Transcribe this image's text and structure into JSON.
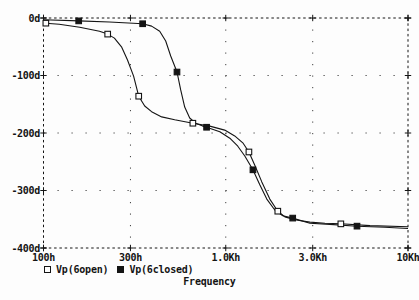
{
  "page": {
    "background": "#fdfdfd",
    "ink": "#141414"
  },
  "chart_data": {
    "type": "line",
    "title": "",
    "xlabel": "Frequency",
    "ylabel": "",
    "x_scale": "log",
    "xlim": [
      100,
      10000
    ],
    "ylim": [
      -400,
      0
    ],
    "grid": "dotted interior gridlines, dashed plot border with + tick marks",
    "legend_position": "bottom-left",
    "x_ticks": [
      {
        "value": 100,
        "label": "100h"
      },
      {
        "value": 300,
        "label": "300h"
      },
      {
        "value": 1000,
        "label": "1.0Kh"
      },
      {
        "value": 3000,
        "label": "3.0Kh"
      },
      {
        "value": 10000,
        "label": "10Kh"
      }
    ],
    "y_ticks": [
      {
        "value": 0,
        "label": "0d"
      },
      {
        "value": -100,
        "label": "-100d"
      },
      {
        "value": -200,
        "label": "-200d"
      },
      {
        "value": -300,
        "label": "-300d"
      },
      {
        "value": -400,
        "label": "-400d"
      }
    ],
    "series": [
      {
        "name": "Vp(6open)",
        "marker": "open-square",
        "color": "#141414",
        "points": [
          [
            100,
            -8
          ],
          [
            103,
            -9
          ],
          [
            122,
            -11
          ],
          [
            158,
            -16
          ],
          [
            203,
            -23
          ],
          [
            225,
            -28
          ],
          [
            245,
            -35
          ],
          [
            268,
            -50
          ],
          [
            289,
            -73
          ],
          [
            312,
            -101
          ],
          [
            333,
            -136
          ],
          [
            359,
            -153
          ],
          [
            392,
            -163
          ],
          [
            445,
            -172
          ],
          [
            525,
            -177
          ],
          [
            660,
            -183
          ],
          [
            817,
            -188
          ],
          [
            987,
            -195
          ],
          [
            1120,
            -205
          ],
          [
            1240,
            -217
          ],
          [
            1340,
            -233
          ],
          [
            1443,
            -256
          ],
          [
            1577,
            -285
          ],
          [
            1745,
            -315
          ],
          [
            1930,
            -336
          ],
          [
            2110,
            -346
          ],
          [
            2394,
            -351
          ],
          [
            2894,
            -355
          ],
          [
            3500,
            -357
          ],
          [
            4280,
            -358
          ],
          [
            6185,
            -361
          ],
          [
            10000,
            -363
          ]
        ],
        "marker_points": [
          [
            103,
            -9
          ],
          [
            225,
            -28
          ],
          [
            333,
            -136
          ],
          [
            660,
            -183
          ],
          [
            1340,
            -233
          ],
          [
            1930,
            -336
          ],
          [
            4280,
            -358
          ]
        ]
      },
      {
        "name": "Vp(6closed)",
        "marker": "filled-square",
        "color": "#141414",
        "points": [
          [
            100,
            -3
          ],
          [
            156,
            -5
          ],
          [
            230,
            -7
          ],
          [
            350,
            -10
          ],
          [
            392,
            -14
          ],
          [
            434,
            -23
          ],
          [
            468,
            -40
          ],
          [
            499,
            -66
          ],
          [
            540,
            -94
          ],
          [
            566,
            -125
          ],
          [
            595,
            -155
          ],
          [
            634,
            -174
          ],
          [
            684,
            -183
          ],
          [
            747,
            -188
          ],
          [
            785,
            -190
          ],
          [
            927,
            -198
          ],
          [
            1052,
            -209
          ],
          [
            1164,
            -223
          ],
          [
            1272,
            -240
          ],
          [
            1410,
            -264
          ],
          [
            1538,
            -290
          ],
          [
            1680,
            -315
          ],
          [
            1859,
            -334
          ],
          [
            2057,
            -344
          ],
          [
            2330,
            -348
          ],
          [
            2894,
            -357
          ],
          [
            3730,
            -359
          ],
          [
            5250,
            -362
          ],
          [
            7470,
            -364
          ],
          [
            10000,
            -366
          ]
        ],
        "marker_points": [
          [
            156,
            -5
          ],
          [
            350,
            -10
          ],
          [
            540,
            -94
          ],
          [
            785,
            -190
          ],
          [
            1410,
            -264
          ],
          [
            2330,
            -348
          ],
          [
            5250,
            -362
          ]
        ]
      }
    ]
  }
}
